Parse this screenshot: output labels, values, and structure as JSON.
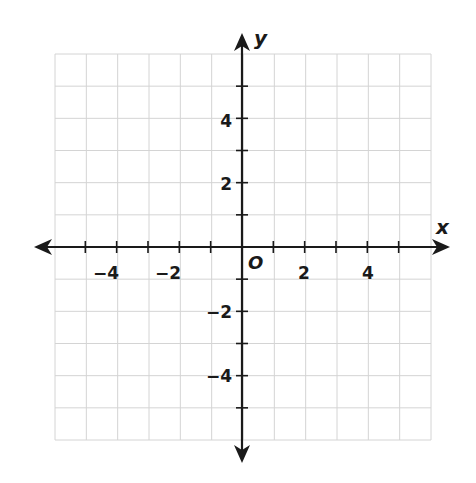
{
  "diagram": {
    "type": "coordinate-plane",
    "x_axis": {
      "label": "x",
      "min": -6,
      "max": 6,
      "tick_step": 1,
      "labeled_ticks": [
        -4,
        -2,
        2,
        4
      ]
    },
    "y_axis": {
      "label": "y",
      "min": -6,
      "max": 6,
      "tick_step": 1,
      "labeled_ticks": [
        4,
        2,
        -2,
        -4
      ]
    },
    "origin_label": "O",
    "grid": {
      "columns": 12,
      "rows": 12,
      "line_color": "#d4d4d4"
    },
    "axis_color": "#1a1a1a"
  },
  "labels": {
    "x_axis": "x",
    "y_axis": "y",
    "origin": "O",
    "x_neg4": "−4",
    "x_neg2": "−2",
    "x_2": "2",
    "x_4": "4",
    "y_4": "4",
    "y_2": "2",
    "y_neg2": "−2",
    "y_neg4": "−4"
  }
}
